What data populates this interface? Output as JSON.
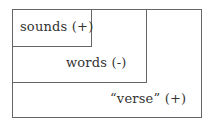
{
  "diagram": {
    "boxes": [
      {
        "id": "verse",
        "label": "“verse” (+)"
      },
      {
        "id": "words",
        "label": "words (-)"
      },
      {
        "id": "sounds",
        "label": "sounds (+)"
      }
    ]
  }
}
